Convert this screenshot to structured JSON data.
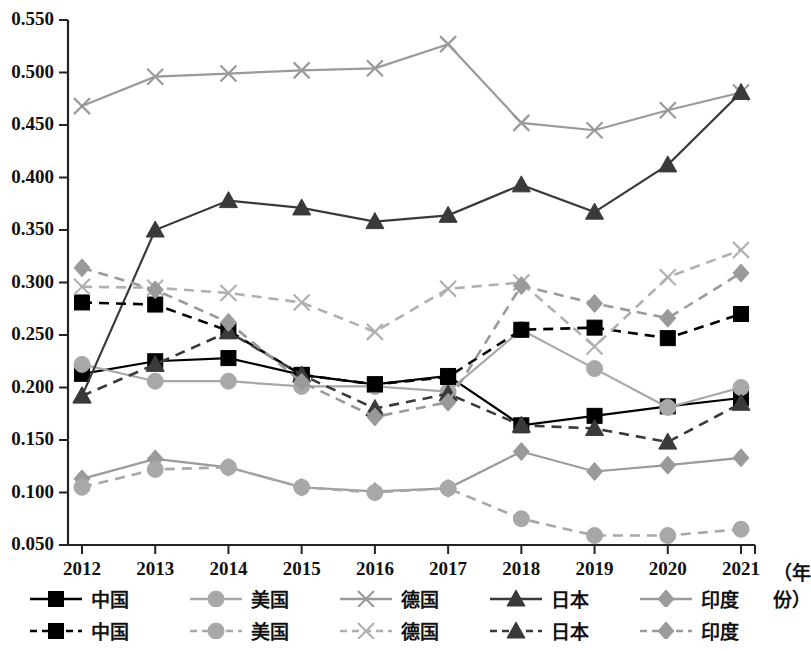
{
  "chart_data": {
    "type": "line",
    "title": "",
    "xlabel": "（年份）",
    "ylabel": "",
    "x": [
      2012,
      2013,
      2014,
      2015,
      2016,
      2017,
      2018,
      2019,
      2020,
      2021
    ],
    "categories": [
      "2012",
      "2013",
      "2014",
      "2015",
      "2016",
      "2017",
      "2018",
      "2019",
      "2020",
      "2021"
    ],
    "ylim": [
      0.05,
      0.55
    ],
    "ytick_values": [
      0.05,
      0.1,
      0.15,
      0.2,
      0.25,
      0.3,
      0.35,
      0.4,
      0.45,
      0.5,
      0.55
    ],
    "ytick_labels": [
      "0.050",
      "0.100",
      "0.150",
      "0.200",
      "0.250",
      "0.300",
      "0.350",
      "0.400",
      "0.450",
      "0.500",
      "0.550"
    ],
    "grid": false,
    "legend_position": "bottom",
    "series": [
      {
        "name": "中国",
        "label": "中国",
        "style": "solid",
        "marker": "square",
        "color": "#000000",
        "values": [
          0.213,
          0.225,
          0.228,
          0.212,
          0.203,
          0.211,
          0.164,
          0.173,
          0.182,
          0.19
        ]
      },
      {
        "name": "美国",
        "label": "美国",
        "style": "solid",
        "marker": "circle",
        "color": "#a8a8a8",
        "values": [
          0.222,
          0.206,
          0.206,
          0.201,
          0.201,
          0.196,
          0.255,
          0.218,
          0.181,
          0.2
        ]
      },
      {
        "name": "德国",
        "label": "德国",
        "style": "solid",
        "marker": "cross",
        "color": "#9a9a9a",
        "values": [
          0.468,
          0.496,
          0.499,
          0.502,
          0.504,
          0.527,
          0.452,
          0.445,
          0.464,
          0.481
        ]
      },
      {
        "name": "日本",
        "label": "日本",
        "style": "solid",
        "marker": "triangle",
        "color": "#3a3a3a",
        "values": [
          0.192,
          0.35,
          0.378,
          0.371,
          0.358,
          0.364,
          0.393,
          0.367,
          0.412,
          0.481
        ]
      },
      {
        "name": "印度",
        "label": "印度",
        "style": "solid",
        "marker": "diamond",
        "color": "#9a9a9a",
        "values": [
          0.113,
          0.132,
          0.124,
          0.105,
          0.101,
          0.104,
          0.139,
          0.12,
          0.126,
          0.133
        ]
      },
      {
        "name": "中国",
        "label": "中国",
        "style": "dashed",
        "marker": "square",
        "color": "#000000",
        "values": [
          0.281,
          0.279,
          0.254,
          0.212,
          0.203,
          0.21,
          0.255,
          0.257,
          0.247,
          0.27
        ]
      },
      {
        "name": "美国",
        "label": "美国",
        "style": "dashed",
        "marker": "circle",
        "color": "#a8a8a8",
        "values": [
          0.105,
          0.122,
          0.124,
          0.105,
          0.1,
          0.104,
          0.075,
          0.059,
          0.059,
          0.065
        ]
      },
      {
        "name": "德国",
        "label": "德国",
        "style": "dashed",
        "marker": "cross",
        "color": "#b0b0b0",
        "values": [
          0.296,
          0.295,
          0.29,
          0.281,
          0.253,
          0.294,
          0.3,
          0.239,
          0.305,
          0.331
        ]
      },
      {
        "name": "日本",
        "label": "日本",
        "style": "dashed",
        "marker": "triangle",
        "color": "#3a3a3a",
        "values": [
          0.192,
          0.222,
          0.253,
          0.212,
          0.18,
          0.194,
          0.164,
          0.161,
          0.148,
          0.185
        ]
      },
      {
        "name": "印度",
        "label": "印度",
        "style": "dashed",
        "marker": "diamond",
        "color": "#9a9a9a",
        "values": [
          0.314,
          0.293,
          0.262,
          0.205,
          0.172,
          0.186,
          0.297,
          0.28,
          0.266,
          0.309
        ]
      }
    ]
  },
  "axis": {
    "x_unit_label": "（年份）"
  }
}
